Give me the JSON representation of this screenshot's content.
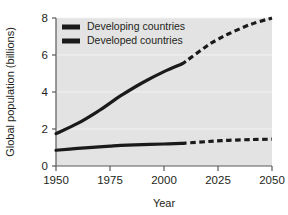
{
  "chart_data": {
    "type": "line",
    "title": "",
    "xlabel": "Year",
    "ylabel": "Global population (billions)",
    "xlim": [
      1950,
      2050
    ],
    "ylim": [
      0,
      8
    ],
    "xticks": [
      1950,
      1975,
      2000,
      2025,
      2050
    ],
    "xtick_labels": [
      "1950",
      "1975",
      "2000",
      "2025",
      "2050"
    ],
    "yticks": [
      0,
      2,
      4,
      6,
      8
    ],
    "ytick_labels": [
      "0",
      "2",
      "4",
      "6",
      "8"
    ],
    "grid": "horizontal-white-faint",
    "legend_position": "top-left-inside",
    "projection_split_year": 2008,
    "projection_style": "dashed",
    "historical_style": "solid",
    "series": [
      {
        "name": "Developing countries",
        "color": "#1a1a1a",
        "x": [
          1950,
          1960,
          1970,
          1975,
          1980,
          1990,
          2000,
          2008,
          2010,
          2020,
          2025,
          2030,
          2040,
          2050
        ],
        "values": [
          1.75,
          2.3,
          3.0,
          3.4,
          3.8,
          4.5,
          5.1,
          5.5,
          5.65,
          6.5,
          6.85,
          7.15,
          7.65,
          8.0
        ]
      },
      {
        "name": "Developed countries",
        "color": "#1a1a1a",
        "x": [
          1950,
          1960,
          1970,
          1975,
          1980,
          1990,
          2000,
          2008,
          2010,
          2020,
          2025,
          2030,
          2040,
          2050
        ],
        "values": [
          0.85,
          0.95,
          1.03,
          1.07,
          1.11,
          1.15,
          1.19,
          1.22,
          1.24,
          1.32,
          1.36,
          1.39,
          1.43,
          1.45
        ]
      }
    ]
  },
  "legend": {
    "items": [
      {
        "label": "Developing countries",
        "swatch": "legend-swatch-developing"
      },
      {
        "label": "Developed countries",
        "swatch": "legend-swatch-developed"
      }
    ]
  },
  "colors": {
    "plot_background": "#e3e3e3",
    "page_background": "#ffffff",
    "line": "#1a1a1a",
    "axis": "#58595b",
    "gridline": "#f2f2f2",
    "text": "#231f20"
  }
}
